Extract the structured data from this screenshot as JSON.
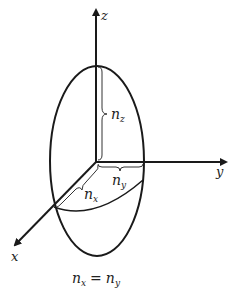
{
  "diagram": {
    "type": "index-ellipsoid",
    "axes": {
      "z": "z",
      "y": "y",
      "x": "x"
    },
    "semi_axes": {
      "nz": {
        "base": "n",
        "sub": "z"
      },
      "ny": {
        "base": "n",
        "sub": "y"
      },
      "nx": {
        "base": "n",
        "sub": "x"
      }
    },
    "caption": {
      "lhs_base": "n",
      "lhs_sub": "x",
      "eq": "=",
      "rhs_base": "n",
      "rhs_sub": "y"
    },
    "colors": {
      "stroke": "#1a1a1a",
      "background": "#ffffff"
    }
  }
}
